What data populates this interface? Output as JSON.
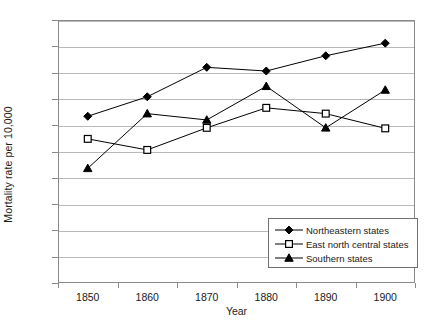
{
  "chart_data": {
    "type": "line",
    "title": "",
    "xlabel": "Year",
    "ylabel": "Mortality rate per 10,000",
    "categories": [
      "1850",
      "1860",
      "1870",
      "1880",
      "1890",
      "1900"
    ],
    "ylim": [
      0,
      50
    ],
    "yticks": [
      "0",
      "5",
      "10",
      "15",
      "20",
      "25",
      "30",
      "35",
      "40",
      "45",
      "50"
    ],
    "grid": true,
    "legend_position": "inside-bottom-right",
    "series": [
      {
        "name": "Northeastern states",
        "marker": "filled-diamond",
        "color": "#000000",
        "values": [
          31.7,
          35.4,
          41.0,
          40.3,
          43.2,
          45.6
        ]
      },
      {
        "name": "East north central states",
        "marker": "open-square",
        "color": "#000000",
        "values": [
          27.4,
          25.3,
          29.5,
          33.3,
          32.2,
          29.4
        ]
      },
      {
        "name": "Southern states",
        "marker": "filled-triangle",
        "color": "#000000",
        "values": [
          21.8,
          32.2,
          31.0,
          37.4,
          29.5,
          36.7
        ]
      }
    ]
  },
  "colors": {
    "line": "#000000",
    "grid": "#b9b9b9",
    "frame": "#8a8a8a",
    "background": "#ffffff"
  }
}
